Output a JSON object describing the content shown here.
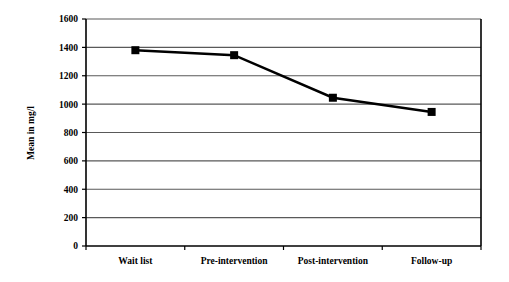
{
  "chart_data": {
    "type": "line",
    "title": "",
    "xlabel": "",
    "ylabel": "Mean in mg/l",
    "categories": [
      "Wait list",
      "Pre-intervention",
      "Post-intervention",
      "Follow-up"
    ],
    "values": [
      1380,
      1345,
      1045,
      945
    ],
    "series": [
      {
        "name": "Mean in mg/l",
        "values": [
          1380,
          1345,
          1045,
          945
        ]
      }
    ],
    "ylim": [
      0,
      1600
    ],
    "ytick_labels": [
      "0",
      "200",
      "400",
      "600",
      "800",
      "1000",
      "1200",
      "1400",
      "1600"
    ],
    "yticks": [
      0,
      200,
      400,
      600,
      800,
      1000,
      1200,
      1400,
      1600
    ],
    "grid": "horizontal",
    "legend": "none",
    "marker": "filled-square",
    "line_color": "#000000",
    "marker_color": "#000000",
    "grid_color": "#595959",
    "axis_color": "#000000",
    "background_color": "#ffffff"
  },
  "axis": {
    "y_title": "Mean in mg/l"
  }
}
